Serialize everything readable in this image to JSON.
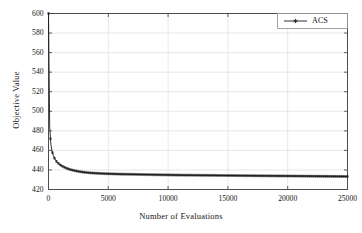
{
  "chart_data": {
    "type": "line",
    "title": "",
    "subtitle": "",
    "xlabel": "Number of Evaluations",
    "ylabel": "Objective Value",
    "xlim": [
      0,
      25000
    ],
    "ylim": [
      420,
      600
    ],
    "xticks": [
      0,
      5000,
      10000,
      15000,
      20000,
      25000
    ],
    "yticks": [
      420,
      440,
      460,
      480,
      500,
      520,
      540,
      560,
      580,
      600
    ],
    "xtick_labels": [
      "0",
      "5000",
      "10000",
      "15000",
      "20000",
      "25000"
    ],
    "ytick_labels": [
      "420",
      "440",
      "460",
      "480",
      "500",
      "520",
      "540",
      "560",
      "580",
      "600"
    ],
    "grid": true,
    "grid_color": "#d9d9d9",
    "axes_color": "#4d4d4d",
    "legend": {
      "position": "top-right",
      "entries": [
        {
          "name": "ACS",
          "color": "#1a1a1a",
          "marker": "asterisk",
          "line_style": "solid"
        }
      ]
    },
    "series": [
      {
        "name": "ACS",
        "color": "#1a1a1a",
        "marker": "asterisk",
        "x": [
          0,
          100,
          200,
          300,
          400,
          500,
          600,
          700,
          800,
          900,
          1000,
          1200,
          1400,
          1600,
          1800,
          2000,
          2250,
          2500,
          2750,
          3000,
          3250,
          3500,
          3750,
          4000,
          4500,
          5000,
          5500,
          6000,
          6500,
          7000,
          7500,
          8000,
          8500,
          9000,
          9500,
          10000,
          11000,
          12000,
          13000,
          14000,
          15000,
          16000,
          17000,
          18000,
          19000,
          20000,
          21000,
          22000,
          23000,
          24000,
          25000
        ],
        "y": [
          600,
          484,
          466,
          459,
          455,
          452,
          450,
          448,
          447,
          446,
          445,
          443.5,
          442.3,
          441.3,
          440.5,
          439.8,
          439.1,
          438.5,
          438.0,
          437.6,
          437.3,
          437.0,
          436.8,
          436.6,
          436.3,
          436.1,
          435.9,
          435.7,
          435.6,
          435.5,
          435.4,
          435.3,
          435.2,
          435.1,
          435.0,
          434.9,
          434.7,
          434.6,
          434.5,
          434.4,
          434.3,
          434.2,
          434.1,
          434.0,
          433.9,
          433.8,
          433.7,
          433.6,
          433.5,
          433.4,
          433.3
        ]
      }
    ]
  }
}
